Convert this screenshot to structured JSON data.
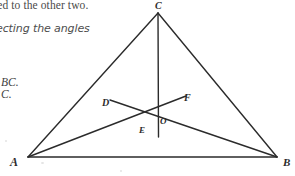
{
  "page": {
    "width": 295,
    "height": 176,
    "background_color": "#ffffff",
    "ink_color": "#2b2b2b"
  },
  "margin_text": {
    "line_1": "ted to the other two.",
    "line_2": "ecting the angles",
    "line_3": "BC.",
    "line_4": "C."
  },
  "figure": {
    "vertices": [
      {
        "id": "A",
        "label": "A",
        "x": 28,
        "y": 157
      },
      {
        "id": "B",
        "label": "B",
        "x": 277,
        "y": 157
      },
      {
        "id": "C",
        "label": "C",
        "x": 158,
        "y": 13
      }
    ],
    "interior_points": [
      {
        "id": "D",
        "label": "D",
        "x": 112,
        "y": 101
      },
      {
        "id": "F",
        "label": "F",
        "x": 184,
        "y": 97
      },
      {
        "id": "O",
        "label": "O",
        "x": 159,
        "y": 113
      },
      {
        "id": "E",
        "label": "E",
        "x": 158,
        "y": 136
      }
    ],
    "sides": [
      {
        "name": "AB",
        "from": "A",
        "to": "B"
      },
      {
        "name": "AC",
        "from": "A",
        "to": "C"
      },
      {
        "name": "BC",
        "from": "B",
        "to": "C"
      }
    ],
    "cevians": [
      {
        "name": "AF",
        "from": "A",
        "to": "F",
        "description": "segment from A through O toward F"
      },
      {
        "name": "BD",
        "from": "B",
        "to": "D",
        "description": "segment from B through O toward D"
      },
      {
        "name": "CE",
        "from": "C",
        "to": "E",
        "description": "vertical segment from C through O to E"
      }
    ],
    "stroke_width": 1.3
  }
}
